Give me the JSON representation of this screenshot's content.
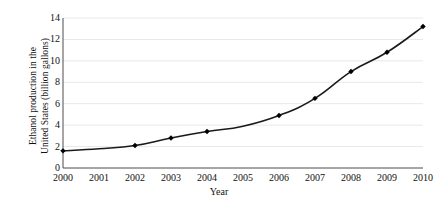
{
  "chart_data": {
    "type": "line",
    "title": "",
    "subtitle": "",
    "xlabel": "Year",
    "ylabel": "Ethanol production in the United States (billion gallons)",
    "ylabel_line1": "Ethanol production in the",
    "ylabel_line2": "United States (billion gallons)",
    "x": [
      2000,
      2001,
      2002,
      2003,
      2004,
      2005,
      2006,
      2007,
      2008,
      2009,
      2010
    ],
    "categories": [
      "2000",
      "2001",
      "2002",
      "2003",
      "2004",
      "2005",
      "2006",
      "2007",
      "2008",
      "2009",
      "2010"
    ],
    "values": [
      1.6,
      1.8,
      2.1,
      2.8,
      3.4,
      3.9,
      4.9,
      6.5,
      9.0,
      10.8,
      13.2
    ],
    "series": [
      {
        "name": "Ethanol production",
        "values": [
          1.6,
          1.8,
          2.1,
          2.8,
          3.4,
          3.9,
          4.9,
          6.5,
          9.0,
          10.8,
          13.2
        ],
        "marker": "diamond",
        "marked_points": [
          2000,
          2002,
          2003,
          2004,
          2006,
          2007,
          2008,
          2009,
          2010
        ],
        "line_color": "#1a1a1a",
        "marker_color": "#000000"
      }
    ],
    "xlim": [
      2000,
      2010
    ],
    "ylim": [
      0,
      14
    ],
    "ytick_values": [
      0,
      2,
      4,
      6,
      8,
      10,
      12,
      14
    ],
    "ytick_labels": [
      "0",
      "2",
      "4",
      "6",
      "8",
      "10",
      "12",
      "14"
    ],
    "xtick_labels": [
      "2000",
      "2001",
      "2002",
      "2003",
      "2004",
      "2005",
      "2006",
      "2007",
      "2008",
      "2009",
      "2010"
    ],
    "grid": {
      "horizontal": true,
      "vertical": false,
      "color": "#e8e8e8"
    },
    "legend": {
      "visible": false,
      "position": "none",
      "entries": []
    },
    "axis_color": "#4d4d4d",
    "background_color": "#ffffff"
  },
  "axes": {
    "y_title_line1": "Ethanol production in the",
    "y_title_line2": "United States (billion gallons)",
    "x_title": "Year"
  },
  "y_ticks": [
    {
      "label": "14",
      "value": 14
    },
    {
      "label": "12",
      "value": 12
    },
    {
      "label": "10",
      "value": 10
    },
    {
      "label": "8",
      "value": 8
    },
    {
      "label": "6",
      "value": 6
    },
    {
      "label": "4",
      "value": 4
    },
    {
      "label": "2",
      "value": 2
    },
    {
      "label": "0",
      "value": 0
    }
  ],
  "x_ticks": [
    {
      "label": "2000",
      "value": 2000
    },
    {
      "label": "2001",
      "value": 2001
    },
    {
      "label": "2002",
      "value": 2002
    },
    {
      "label": "2003",
      "value": 2003
    },
    {
      "label": "2004",
      "value": 2004
    },
    {
      "label": "2005",
      "value": 2005
    },
    {
      "label": "2006",
      "value": 2006
    },
    {
      "label": "2007",
      "value": 2007
    },
    {
      "label": "2008",
      "value": 2008
    },
    {
      "label": "2009",
      "value": 2009
    },
    {
      "label": "2010",
      "value": 2010
    }
  ]
}
